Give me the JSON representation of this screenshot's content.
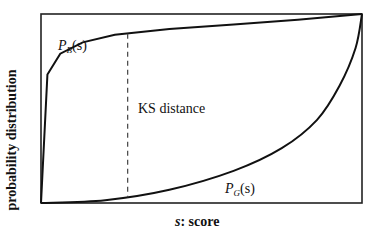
{
  "chart_data": {
    "type": "line",
    "title": "",
    "xlabel_var": "s",
    "xlabel_text": ": score",
    "ylabel": "probability distribution",
    "series": [
      {
        "name": "P_B(s)",
        "label_main": "P",
        "label_sub": "B",
        "label_arg": "(s)",
        "description": "concave CDF, rises steeply then approaches top right",
        "x": [
          0,
          0.02,
          0.06,
          0.13,
          0.23,
          0.4,
          0.6,
          0.8,
          1.0
        ],
        "y": [
          0,
          0.68,
          0.79,
          0.85,
          0.89,
          0.92,
          0.945,
          0.97,
          1.0
        ]
      },
      {
        "name": "P_G(s)",
        "label_main": "P",
        "label_sub": "G",
        "label_arg": "(s)",
        "description": "convex CDF, stays low then rises sharply near right",
        "x": [
          0,
          0.2,
          0.4,
          0.6,
          0.75,
          0.86,
          0.93,
          0.98,
          1.0
        ],
        "y": [
          0,
          0.015,
          0.07,
          0.17,
          0.29,
          0.44,
          0.62,
          0.82,
          1.0
        ]
      }
    ],
    "annotations": [
      {
        "text": "KS distance",
        "type": "dashed-vertical-line",
        "x": 0.27
      }
    ],
    "grid": false,
    "legend": "none (inline labels)",
    "xlim": [
      0,
      1
    ],
    "ylim": [
      0,
      1
    ]
  },
  "labels": {
    "ks": "KS distance"
  }
}
